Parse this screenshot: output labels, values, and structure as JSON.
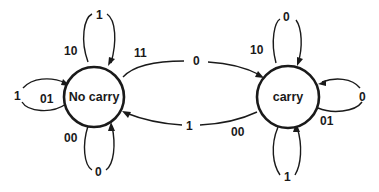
{
  "diagram": {
    "type": "finite-state-machine",
    "states": [
      {
        "id": "no_carry",
        "label": "No carry"
      },
      {
        "id": "carry",
        "label": "carry"
      }
    ],
    "transitions": [
      {
        "from": "no_carry",
        "to": "no_carry",
        "input": "10",
        "output": "1",
        "position": "top"
      },
      {
        "from": "no_carry",
        "to": "no_carry",
        "input": "01",
        "output": "1",
        "position": "left"
      },
      {
        "from": "no_carry",
        "to": "no_carry",
        "input": "00",
        "output": "0",
        "position": "bottom"
      },
      {
        "from": "no_carry",
        "to": "carry",
        "input": "11",
        "output": "0",
        "position": "upper-arc"
      },
      {
        "from": "carry",
        "to": "no_carry",
        "input": "00",
        "output": "1",
        "position": "lower-arc"
      },
      {
        "from": "carry",
        "to": "carry",
        "input": "10",
        "output": "0",
        "position": "top"
      },
      {
        "from": "carry",
        "to": "carry",
        "input": "01",
        "output": "0",
        "position": "right"
      },
      {
        "from": "carry",
        "to": "carry",
        "input": "00",
        "output": "1",
        "position": "bottom"
      }
    ]
  },
  "labels": {
    "nc_top_in": "10",
    "nc_top_out": "1",
    "nc_left_in": "01",
    "nc_left_out": "1",
    "nc_bottom_in": "00",
    "nc_bottom_out": "0",
    "nc_to_c_in": "11",
    "nc_to_c_out": "0",
    "c_to_nc_in": "00",
    "c_to_nc_out": "1",
    "c_top_in": "10",
    "c_top_out": "0",
    "c_right_in": "01",
    "c_right_out": "0",
    "c_bottom_in": "00",
    "c_bottom_out": "1"
  },
  "colors": {
    "stroke": "#1a1a1a",
    "background": "#ffffff"
  }
}
